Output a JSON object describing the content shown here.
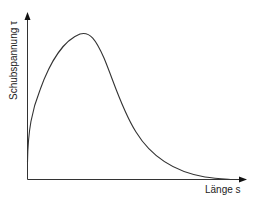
{
  "diagram": {
    "y_axis_label": "Schubspannung τ",
    "x_axis_label": "Länge s",
    "curve_description": "Schubspannung über die Länge: steiler Anstieg, Maximum, dann asymptotischer Abfall gegen null",
    "colors": {
      "axis": "#222222",
      "curve": "#333333",
      "background": "#ffffff"
    }
  }
}
